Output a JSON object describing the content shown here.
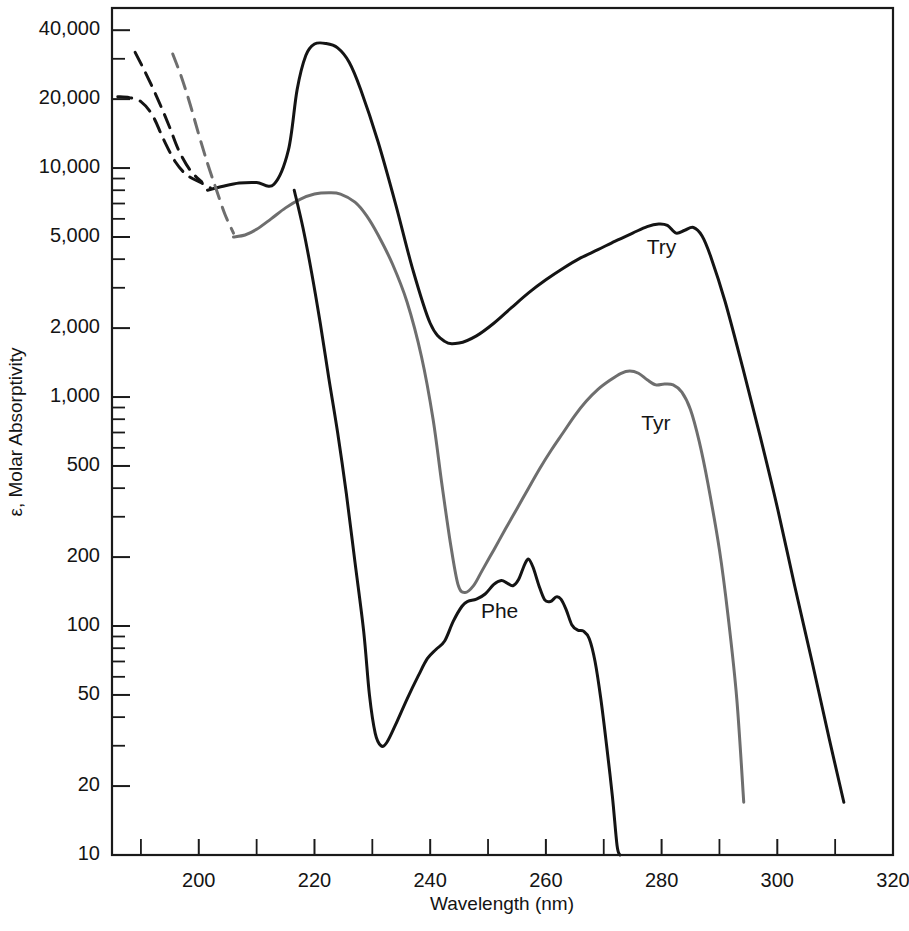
{
  "figure": {
    "background": "#ffffff",
    "frame_color": "#1a1a1a"
  },
  "chart_data": {
    "type": "line",
    "title": "",
    "xlabel": "Wavelength (nm)",
    "ylabel": "ε, Molar Absorptivity",
    "xlim": [
      185,
      320
    ],
    "ylim": [
      10,
      50000
    ],
    "yscale": "log",
    "xscale": "linear",
    "grid": false,
    "legend": "inline-annotations",
    "x_ticks_major": [
      200,
      220,
      240,
      260,
      280,
      300,
      320
    ],
    "x_ticks_minor": [
      190,
      210,
      230,
      250,
      270,
      290,
      310
    ],
    "x_tick_labels": [
      "200",
      "220",
      "240",
      "260",
      "280",
      "300",
      "320"
    ],
    "y_ticks_labeled": [
      10,
      20,
      50,
      100,
      200,
      500,
      1000,
      2000,
      5000,
      10000,
      20000,
      40000
    ],
    "y_tick_labels": [
      "10",
      "20",
      "50",
      "100",
      "200",
      "500",
      "1,000",
      "2,000",
      "5,000",
      "10,000",
      "20,000",
      "40,000"
    ],
    "y_ticks_minor": [
      30,
      40,
      60,
      70,
      80,
      90,
      300,
      400,
      600,
      700,
      800,
      900,
      3000,
      4000,
      6000,
      7000,
      8000,
      9000,
      30000
    ],
    "series": [
      {
        "name": "Try",
        "label": "Try",
        "color": "#141414",
        "stroke_width": 3.0,
        "label_x": 280,
        "label_y": 4200,
        "points": [
          [
            201.5,
            8000
          ],
          [
            204,
            8300
          ],
          [
            207,
            8600
          ],
          [
            210,
            8650
          ],
          [
            213,
            8500
          ],
          [
            215.5,
            12000
          ],
          [
            217,
            22000
          ],
          [
            218.5,
            31000
          ],
          [
            220,
            34800
          ],
          [
            222,
            35000
          ],
          [
            224,
            33500
          ],
          [
            226,
            29000
          ],
          [
            228,
            22000
          ],
          [
            231,
            13000
          ],
          [
            234,
            7000
          ],
          [
            237,
            3600
          ],
          [
            240,
            2100
          ],
          [
            242.5,
            1750
          ],
          [
            245,
            1720
          ],
          [
            248,
            1850
          ],
          [
            251,
            2100
          ],
          [
            254,
            2450
          ],
          [
            257,
            2850
          ],
          [
            260,
            3250
          ],
          [
            263,
            3650
          ],
          [
            266,
            4050
          ],
          [
            269,
            4400
          ],
          [
            272,
            4800
          ],
          [
            275,
            5200
          ],
          [
            277.5,
            5550
          ],
          [
            279.5,
            5700
          ],
          [
            281,
            5620
          ],
          [
            282.5,
            5200
          ],
          [
            284,
            5350
          ],
          [
            285.5,
            5500
          ],
          [
            287,
            5050
          ],
          [
            288.5,
            4100
          ],
          [
            291,
            2600
          ],
          [
            294,
            1350
          ],
          [
            297,
            680
          ],
          [
            300,
            330
          ],
          [
            303,
            150
          ],
          [
            306,
            70
          ],
          [
            309,
            32
          ],
          [
            311.5,
            17
          ]
        ],
        "dashed_extension": {
          "points": [
            [
              186,
              20500
            ],
            [
              188,
              20300
            ],
            [
              190,
              19500
            ],
            [
              192,
              17000
            ],
            [
              194,
              13200
            ],
            [
              196,
              10600
            ],
            [
              198,
              9300
            ],
            [
              200.5,
              8600
            ],
            [
              202,
              8200
            ]
          ],
          "dash_pattern": "14,9"
        },
        "dashed_upper": {
          "points": [
            [
              189,
              32000
            ],
            [
              190.5,
              27000
            ],
            [
              192,
              22500
            ],
            [
              193.5,
              18500
            ],
            [
              195,
              15000
            ],
            [
              196.5,
              12000
            ],
            [
              198.5,
              9800
            ],
            [
              200.5,
              8700
            ]
          ],
          "dash_pattern": "14,9"
        }
      },
      {
        "name": "Tyr",
        "label": "Tyr",
        "color": "#6e6e6e",
        "stroke_width": 3.0,
        "label_x": 279,
        "label_y": 720,
        "points": [
          [
            206,
            5000
          ],
          [
            208,
            5100
          ],
          [
            210,
            5400
          ],
          [
            212.5,
            6000
          ],
          [
            215,
            6700
          ],
          [
            217.5,
            7300
          ],
          [
            220,
            7700
          ],
          [
            222.5,
            7800
          ],
          [
            224.5,
            7700
          ],
          [
            227,
            7100
          ],
          [
            229,
            6200
          ],
          [
            231,
            5100
          ],
          [
            233.5,
            3800
          ],
          [
            236,
            2600
          ],
          [
            238.5,
            1500
          ],
          [
            240.5,
            800
          ],
          [
            242,
            420
          ],
          [
            243.5,
            230
          ],
          [
            244.8,
            152
          ],
          [
            246,
            140
          ],
          [
            247.5,
            150
          ],
          [
            249,
            175
          ],
          [
            251,
            215
          ],
          [
            253,
            265
          ],
          [
            255,
            325
          ],
          [
            257,
            400
          ],
          [
            259,
            490
          ],
          [
            261,
            590
          ],
          [
            263,
            700
          ],
          [
            265,
            830
          ],
          [
            267,
            960
          ],
          [
            269,
            1080
          ],
          [
            271,
            1180
          ],
          [
            273,
            1270
          ],
          [
            274.5,
            1300
          ],
          [
            276,
            1270
          ],
          [
            277.5,
            1190
          ],
          [
            279,
            1130
          ],
          [
            280.5,
            1140
          ],
          [
            282,
            1130
          ],
          [
            283.5,
            1050
          ],
          [
            285,
            880
          ],
          [
            286.5,
            640
          ],
          [
            288,
            420
          ],
          [
            290,
            215
          ],
          [
            291.5,
            110
          ],
          [
            293,
            48
          ],
          [
            294.2,
            17
          ]
        ],
        "dashed_extension": {
          "points": [
            [
              195.5,
              31500
            ],
            [
              197,
              25000
            ],
            [
              198.5,
              19000
            ],
            [
              200,
              14000
            ],
            [
              201.5,
              10500
            ],
            [
              203,
              8100
            ],
            [
              204.5,
              6300
            ],
            [
              206,
              5200
            ]
          ],
          "dash_pattern": "14,9"
        }
      },
      {
        "name": "Phe",
        "label": "Phe",
        "color": "#141414",
        "stroke_width": 3.0,
        "label_x": 252,
        "label_y": 108,
        "points": [
          [
            216.5,
            8000
          ],
          [
            218,
            5500
          ],
          [
            219.5,
            3500
          ],
          [
            221,
            2100
          ],
          [
            222.5,
            1200
          ],
          [
            224,
            700
          ],
          [
            225.5,
            380
          ],
          [
            227,
            190
          ],
          [
            228.5,
            95
          ],
          [
            229.5,
            50
          ],
          [
            230.5,
            34
          ],
          [
            231.5,
            30
          ],
          [
            232.5,
            31
          ],
          [
            234,
            37
          ],
          [
            236,
            48
          ],
          [
            238,
            61
          ],
          [
            239.5,
            72
          ],
          [
            241,
            79
          ],
          [
            242.5,
            86
          ],
          [
            244,
            105
          ],
          [
            245.5,
            122
          ],
          [
            246.5,
            128
          ],
          [
            248,
            131
          ],
          [
            249.5,
            138
          ],
          [
            251,
            152
          ],
          [
            252.3,
            158
          ],
          [
            253.3,
            154
          ],
          [
            254.3,
            150
          ],
          [
            255.3,
            160
          ],
          [
            256.3,
            185
          ],
          [
            257,
            196
          ],
          [
            257.8,
            180
          ],
          [
            258.8,
            150
          ],
          [
            259.8,
            130
          ],
          [
            260.8,
            128
          ],
          [
            261.8,
            134
          ],
          [
            262.6,
            131
          ],
          [
            263.5,
            118
          ],
          [
            264.5,
            101
          ],
          [
            265.5,
            96
          ],
          [
            266.5,
            95
          ],
          [
            267.5,
            88
          ],
          [
            268.5,
            70
          ],
          [
            269.5,
            48
          ],
          [
            270.5,
            30
          ],
          [
            271.5,
            18
          ],
          [
            272.3,
            11
          ],
          [
            272.8,
            10
          ]
        ]
      }
    ]
  },
  "axis": {
    "x_title": "Wavelength (nm)",
    "y_title": "ε, Molar Absorptivity"
  }
}
